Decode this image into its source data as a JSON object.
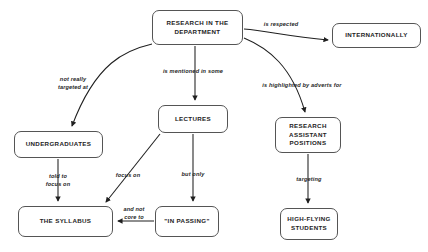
{
  "diagram": {
    "background_color": "#ffffff",
    "node_border_color": "#555555",
    "text_color": "#232323",
    "edge_color": "#1f1f1f",
    "nodes": [
      {
        "id": "research",
        "label": "RESEARCH IN THE\nDEPARTMENT",
        "x": 152,
        "y": 10,
        "w": 91,
        "h": 35
      },
      {
        "id": "internationally",
        "label": "INTERNATIONALLY",
        "x": 332,
        "y": 23,
        "w": 89,
        "h": 25
      },
      {
        "id": "undergraduates",
        "label": "UNDERGRADUATES",
        "x": 14,
        "y": 131,
        "w": 89,
        "h": 27
      },
      {
        "id": "lectures",
        "label": "LECTURES",
        "x": 158,
        "y": 105,
        "w": 70,
        "h": 28
      },
      {
        "id": "ra_positions",
        "label": "RESEARCH\nASSISTANT\nPOSITIONS",
        "x": 275,
        "y": 117,
        "w": 66,
        "h": 36
      },
      {
        "id": "syllabus",
        "label": "THE SYLLABUS",
        "x": 18,
        "y": 206,
        "w": 95,
        "h": 31
      },
      {
        "id": "in_passing",
        "label": "\"IN PASSING\"",
        "x": 155,
        "y": 206,
        "w": 64,
        "h": 31
      },
      {
        "id": "hf_students",
        "label": "HIGH-FLYING\nSTUDENTS",
        "x": 280,
        "y": 208,
        "w": 58,
        "h": 32
      }
    ],
    "edge_labels": [
      {
        "id": "l_respected",
        "text": "is respected",
        "x": 281,
        "y": 25
      },
      {
        "id": "l_not_really",
        "text": "not really\ntargeted at",
        "x": 73,
        "y": 84
      },
      {
        "id": "l_mentioned",
        "text": "is mentioned in some",
        "x": 193,
        "y": 72
      },
      {
        "id": "l_adverts",
        "text": "is highlighted by adverts for",
        "x": 302,
        "y": 86
      },
      {
        "id": "l_told_to",
        "text": "told to\nfocus on",
        "x": 58,
        "y": 181
      },
      {
        "id": "l_focus_on",
        "text": "focus on",
        "x": 128,
        "y": 176
      },
      {
        "id": "l_but_only",
        "text": "but only",
        "x": 193,
        "y": 175
      },
      {
        "id": "l_targeting",
        "text": "targeting",
        "x": 309,
        "y": 180
      },
      {
        "id": "l_not_core",
        "text": "and not\ncore to",
        "x": 134,
        "y": 214
      }
    ],
    "edges": [
      {
        "id": "e_research_internationally",
        "from": "research",
        "to": "internationally",
        "relation": "is respected"
      },
      {
        "id": "e_research_undergraduates",
        "from": "research",
        "to": "undergraduates",
        "relation": "not really targeted at"
      },
      {
        "id": "e_research_lectures",
        "from": "research",
        "to": "lectures",
        "relation": "is mentioned in some"
      },
      {
        "id": "e_research_ra",
        "from": "research",
        "to": "ra_positions",
        "relation": "is highlighted by adverts for"
      },
      {
        "id": "e_undergrad_syllabus",
        "from": "undergraduates",
        "to": "syllabus",
        "relation": "told to focus on"
      },
      {
        "id": "e_lectures_syllabus",
        "from": "lectures",
        "to": "syllabus",
        "relation": "focus on"
      },
      {
        "id": "e_lectures_inpassing",
        "from": "lectures",
        "to": "in_passing",
        "relation": "but only"
      },
      {
        "id": "e_inpassing_syllabus",
        "from": "in_passing",
        "to": "syllabus",
        "relation": "and not core to"
      },
      {
        "id": "e_ra_students",
        "from": "ra_positions",
        "to": "hf_students",
        "relation": "targeting"
      }
    ]
  }
}
